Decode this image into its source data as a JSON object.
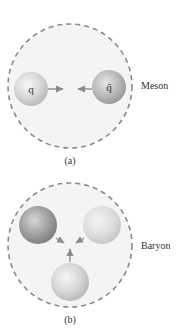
{
  "panels": [
    {
      "id": "a",
      "caption": "(a)",
      "name": "Meson",
      "quarks": [
        {
          "label": "q",
          "shade": "light"
        },
        {
          "label": "q̄",
          "shade": "medium"
        }
      ]
    },
    {
      "id": "b",
      "caption": "(b)",
      "name": "Baryon",
      "quarks": [
        {
          "label": "",
          "shade": "dark"
        },
        {
          "label": "",
          "shade": "light"
        },
        {
          "label": "",
          "shade": "medium"
        }
      ]
    }
  ],
  "colors": {
    "boundary": "#8a8a8a",
    "fill": "#f3f3f3",
    "arrow": "#8c8c8c",
    "text": "#333333"
  }
}
